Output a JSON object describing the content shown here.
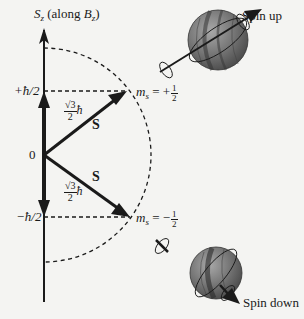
{
  "axis": {
    "label_main": "S",
    "label_sub": "z",
    "label_paren_open": " (along ",
    "label_field": "B",
    "label_field_sub": "z",
    "label_paren_close": ")"
  },
  "ticks": {
    "plus": "+ħ/2",
    "zero": "0",
    "minus": "−ħ/2"
  },
  "vectors": {
    "upper": {
      "name": "S",
      "magnitude_num": "√3",
      "magnitude_den": "2",
      "magnitude_unit": "ħ"
    },
    "lower": {
      "name": "S",
      "magnitude_num": "√3",
      "magnitude_den": "2",
      "magnitude_unit": "ħ"
    }
  },
  "states": {
    "up": {
      "symbol": "m",
      "sub": "s",
      "eq": " = ",
      "sign": "+",
      "num": "1",
      "den": "2",
      "spin_label": "Spin up"
    },
    "down": {
      "symbol": "m",
      "sub": "s",
      "eq": " = ",
      "sign": "−",
      "num": "1",
      "den": "2",
      "spin_label": "Spin down"
    }
  },
  "colors": {
    "background": "#f4f4f2",
    "ink": "#1a1a1a",
    "sphere_light": "#9a9a9a",
    "sphere_mid": "#6e6e6e",
    "sphere_dark": "#3a3a3a"
  }
}
